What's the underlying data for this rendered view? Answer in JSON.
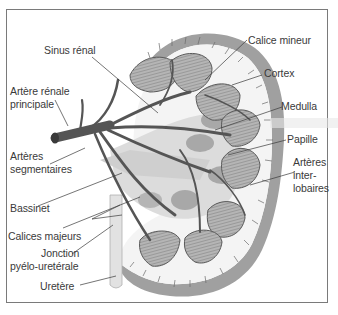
{
  "diagram": {
    "colors": {
      "frame": "#7a7a7a",
      "text": "#3a3a3a",
      "capsule": "#9a9a9a",
      "pyramid": "#8c8c8c",
      "artery": "#555555",
      "pelvis": "#d6d6d6",
      "calyx": "#a8a8a8"
    },
    "labels": {
      "sinus_renal": "Sinus rénal",
      "calice_mineur": "Calice mineur",
      "cortex": "Cortex",
      "artere_renale_l1": "Artère rénale",
      "artere_renale_l2": "principale",
      "medulla": "Medulla",
      "papille": "Papille",
      "arteres_segmentaires_l1": "Artères",
      "arteres_segmentaires_l2": "segmentaires",
      "arteres_interlobaires_l1": "Artères",
      "arteres_interlobaires_l2": "inter-",
      "arteres_interlobaires_l3": "lobaires",
      "bassinet": "Bassinet",
      "calices_majeurs": "Calices majeurs",
      "jonction_l1": "Jonction",
      "jonction_l2": "pyélo-uretérale",
      "uretere": "Uretère"
    }
  }
}
